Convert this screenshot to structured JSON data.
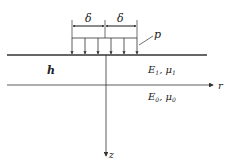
{
  "diagram": {
    "labels": {
      "delta_left": "δ",
      "delta_right": "δ",
      "pressure": "p",
      "thickness": "h",
      "layer1": "E",
      "layer1_sub": "1",
      "layer1_sep": ", μ",
      "layer1_sub2": "1",
      "layer0": "E",
      "layer0_sub": "0",
      "layer0_sep": ", μ",
      "layer0_sub2": "0",
      "r_axis": "r",
      "z_axis": "z"
    },
    "colors": {
      "line": "#333333",
      "text": "#222222"
    }
  }
}
